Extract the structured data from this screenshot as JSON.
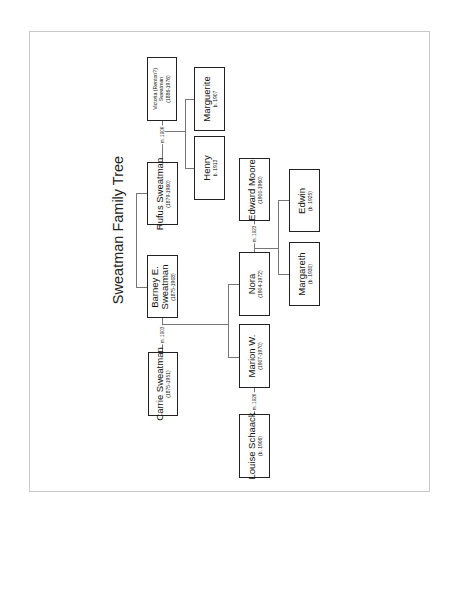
{
  "title": "Sweatman Family Tree",
  "people": {
    "victoria": {
      "name": "Victoria (Renton?)",
      "name2": "Sweatman",
      "dates": "(1886-1976)"
    },
    "rufus": {
      "name": "Rufus Sweatman",
      "dates": "(1879-1960)"
    },
    "barney": {
      "name": "Barney E.",
      "name2": "Sweatman",
      "dates": "(1875-1908)"
    },
    "carrie": {
      "name": "Carrie Sweatman",
      "dates": "(1875-1951)"
    },
    "marguerite": {
      "name": "Marguerite",
      "dates": "b. 1907"
    },
    "henry": {
      "name": "Henry",
      "dates": "b. 1913"
    },
    "edward": {
      "name": "Edward Moore",
      "dates": "(1900-1960)"
    },
    "nora": {
      "name": "Nora",
      "dates": "(1904-1972)"
    },
    "marion": {
      "name": "Marion W.",
      "dates": "(1907-1970)"
    },
    "louise": {
      "name": "Louise Schaack",
      "dates": "(b. 1906)"
    },
    "edwin": {
      "name": "Edwin",
      "dates": "(b. 1925)"
    },
    "margareth": {
      "name": "Margareth",
      "dates": "(b. 1930)"
    }
  },
  "marriages": {
    "rufus_victoria": "m. 1906",
    "barney_carrie": "m. 1903",
    "nora_edward": "m. 1923",
    "marion_louise": "m. 1926"
  },
  "colors": {
    "box_border": "#222222",
    "connector": "#777777",
    "frame": "#c8c8c8"
  }
}
